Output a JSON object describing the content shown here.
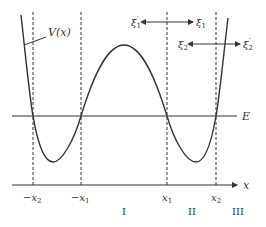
{
  "diagram": {
    "type": "double-well potential",
    "curve_label": "V(x)",
    "energy_label": "E",
    "axis_label": "x",
    "ticks": [
      {
        "label": "−x",
        "sub": "2",
        "x": 33
      },
      {
        "label": "−x",
        "sub": "1",
        "x": 81
      },
      {
        "label": "x",
        "sub": "1",
        "x": 167
      },
      {
        "label": "x",
        "sub": "2",
        "x": 216
      }
    ],
    "regions": [
      {
        "label": "I",
        "x": 124
      },
      {
        "label": "II",
        "x": 192
      },
      {
        "label": "III",
        "x": 236
      }
    ],
    "arrows": [
      {
        "left_label": "ξ",
        "left_sub": "1",
        "left_prime": "′",
        "right_label": "ξ",
        "right_sub": "1",
        "right_prime": ""
      },
      {
        "left_label": "ξ",
        "left_sub": "2",
        "left_prime": "",
        "right_label": "ξ",
        "right_sub": "2",
        "right_prime": "′"
      }
    ],
    "colors": {
      "line": "#333333",
      "background": "#ffffff"
    }
  }
}
